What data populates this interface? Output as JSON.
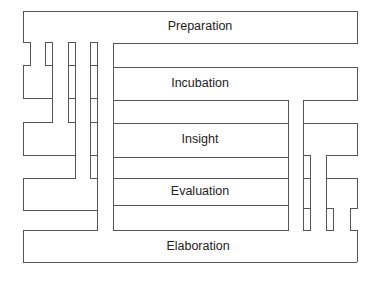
{
  "diagram": {
    "type": "creative-process-stages",
    "stages": [
      {
        "id": "preparation",
        "label": "Preparation"
      },
      {
        "id": "incubation",
        "label": "Incubation"
      },
      {
        "id": "insight",
        "label": "Insight"
      },
      {
        "id": "evaluation",
        "label": "Evaluation"
      },
      {
        "id": "elaboration",
        "label": "Elaboration"
      }
    ],
    "colors": {
      "line": "#555555",
      "text": "#222222",
      "background": "#ffffff"
    }
  }
}
